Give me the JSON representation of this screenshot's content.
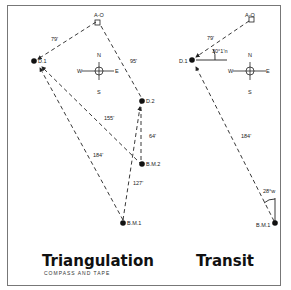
{
  "left_panel": {
    "title": "Triangulation",
    "subtitle": "COMPASS AND TAPE",
    "points": {
      "ao": "A-O",
      "d1": "D.1",
      "d2": "D.2",
      "bm2": "B.M.2",
      "bm1": "B.M.1"
    },
    "distances": {
      "d1_ao": "79'",
      "ao_d2": "95'",
      "d1_bm2": "155'",
      "d2_bm2": "64'",
      "d1_bm1": "184'",
      "bm2_bm1": "127'"
    },
    "compass": {
      "n": "N",
      "s": "S",
      "e": "E",
      "w": "W"
    }
  },
  "right_panel": {
    "title": "Transit",
    "points": {
      "ao": "A-O",
      "d1": "D.1",
      "bm1": "B.M.1"
    },
    "distances": {
      "d1_ao": "79'",
      "d1_bm1": "184'"
    },
    "angles": {
      "at_d1": "30°1'n",
      "at_bm1": "28°w"
    },
    "compass": {
      "n": "N",
      "s": "S",
      "e": "E",
      "w": "W"
    }
  }
}
